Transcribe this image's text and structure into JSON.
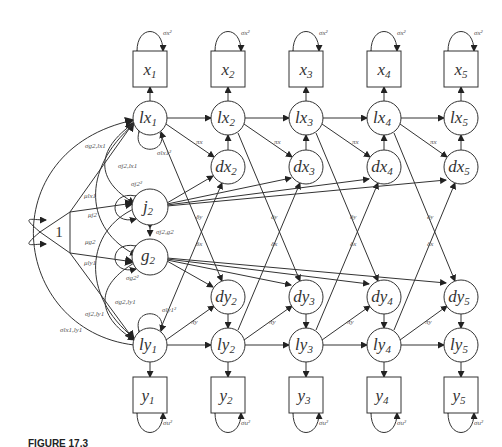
{
  "figure": {
    "caption_partial": "FIGURE 17.3",
    "columns": [
      {
        "index": 1,
        "x": "x",
        "x_sub": "1",
        "lx": "lx",
        "lx_sub": "1",
        "ly": "ly",
        "ly_sub": "1",
        "y": "y",
        "y_sub": "1"
      },
      {
        "index": 2,
        "x": "x",
        "x_sub": "2",
        "lx": "lx",
        "lx_sub": "2",
        "dx": "dx",
        "dx_sub": "2",
        "dy": "dy",
        "dy_sub": "2",
        "ly": "ly",
        "ly_sub": "2",
        "y": "y",
        "y_sub": "2"
      },
      {
        "index": 3,
        "x": "x",
        "x_sub": "3",
        "lx": "lx",
        "lx_sub": "3",
        "dx": "dx",
        "dx_sub": "3",
        "dy": "dy",
        "dy_sub": "3",
        "ly": "ly",
        "ly_sub": "3",
        "y": "y",
        "y_sub": "3"
      },
      {
        "index": 4,
        "x": "x",
        "x_sub": "4",
        "lx": "lx",
        "lx_sub": "4",
        "dx": "dx",
        "dx_sub": "4",
        "dy": "dy",
        "dy_sub": "4",
        "ly": "ly",
        "ly_sub": "4",
        "y": "y",
        "y_sub": "4"
      },
      {
        "index": 5,
        "x": "x",
        "x_sub": "5",
        "lx": "lx",
        "lx_sub": "5",
        "dx": "dx",
        "dx_sub": "5",
        "dy": "dy",
        "dy_sub": "5",
        "ly": "ly",
        "ly_sub": "5",
        "y": "y",
        "y_sub": "5"
      }
    ],
    "constant": "1",
    "j2": {
      "main": "j",
      "sub": "2"
    },
    "g2": {
      "main": "g",
      "sub": "2"
    },
    "params": {
      "sigma_x2": "σx²",
      "sigma_u2": "σu²",
      "sigma_lx1_2": "σlx1²",
      "sigma_ly1_2": "σly1²",
      "sigma_j2_2": "σj2²",
      "sigma_g2_2": "σg2²",
      "sigma_j2g2": "σj2,g2",
      "sigma_g2lx1": "σg2,lx1",
      "sigma_j2lx1": "σj2,lx1",
      "sigma_g2ly1": "σg2,ly1",
      "sigma_j2ly1": "σj2,ly1",
      "sigma_lx1ly1": "σlx1,ly1",
      "mu_lx1": "μlx1",
      "mu_j2": "μj2",
      "mu_g2": "μg2",
      "mu_ly1": "μly1",
      "pi_x": "πx",
      "pi_y": "πy",
      "delta_y": "δy",
      "delta_x": "δx"
    }
  }
}
